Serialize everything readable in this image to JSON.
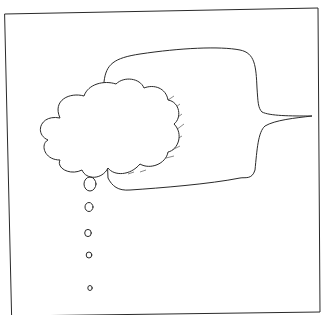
{
  "illustration": {
    "subject": "thought bubble overlapping speech bubble",
    "elements": [
      "frame",
      "speech-bubble",
      "thought-cloud",
      "thought-dots"
    ],
    "thought_dots_count": 5,
    "colors": {
      "background": "#ffffff",
      "ink": "#2a2a2a"
    }
  }
}
